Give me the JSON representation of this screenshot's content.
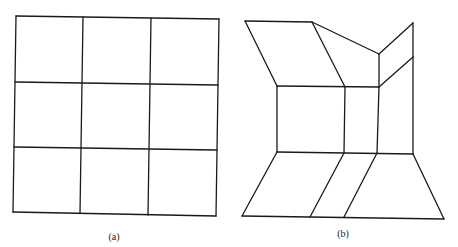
{
  "figures": [
    {
      "id": "a",
      "caption": "(a)",
      "caption_pos": [
        114,
        231
      ],
      "description": "Regular 3x3 grid",
      "stroke": "#1a1a1a",
      "lines": [
        [
          [
            16,
            16
          ],
          [
            219,
            19
          ]
        ],
        [
          [
            15,
            82
          ],
          [
            218,
            85
          ]
        ],
        [
          [
            14,
            147
          ],
          [
            217,
            150
          ]
        ],
        [
          [
            13,
            212
          ],
          [
            216,
            216
          ]
        ],
        [
          [
            16,
            16
          ],
          [
            13,
            212
          ]
        ],
        [
          [
            83,
            17
          ],
          [
            80,
            213
          ]
        ],
        [
          [
            151,
            18
          ],
          [
            148,
            215
          ]
        ],
        [
          [
            219,
            19
          ],
          [
            216,
            216
          ]
        ]
      ]
    },
    {
      "id": "b",
      "caption": "(b)",
      "caption_pos": [
        343,
        228
      ],
      "description": "Distorted grid (perspective room-like mapping)",
      "stroke": "#1a1a1a",
      "lines": [
        [
          [
            245,
            21
          ],
          [
            312,
            22
          ]
        ],
        [
          [
            312,
            22
          ],
          [
            379,
            54
          ]
        ],
        [
          [
            379,
            54
          ],
          [
            413,
            23
          ]
        ],
        [
          [
            245,
            21
          ],
          [
            277,
            86
          ]
        ],
        [
          [
            312,
            22
          ],
          [
            345,
            87
          ]
        ],
        [
          [
            413,
            23
          ],
          [
            413,
            154
          ]
        ],
        [
          [
            379,
            54
          ],
          [
            379,
            87
          ]
        ],
        [
          [
            277,
            86
          ],
          [
            379,
            87
          ]
        ],
        [
          [
            379,
            87
          ],
          [
            413,
            57
          ]
        ],
        [
          [
            277,
            86
          ],
          [
            277,
            152
          ]
        ],
        [
          [
            345,
            87
          ],
          [
            344,
            153
          ]
        ],
        [
          [
            379,
            87
          ],
          [
            377,
            153
          ]
        ],
        [
          [
            277,
            152
          ],
          [
            413,
            154
          ]
        ],
        [
          [
            277,
            152
          ],
          [
            242,
            216
          ]
        ],
        [
          [
            344,
            153
          ],
          [
            310,
            217
          ]
        ],
        [
          [
            377,
            153
          ],
          [
            344,
            217
          ]
        ],
        [
          [
            413,
            154
          ],
          [
            444,
            219
          ]
        ],
        [
          [
            242,
            216
          ],
          [
            444,
            219
          ]
        ]
      ]
    }
  ]
}
